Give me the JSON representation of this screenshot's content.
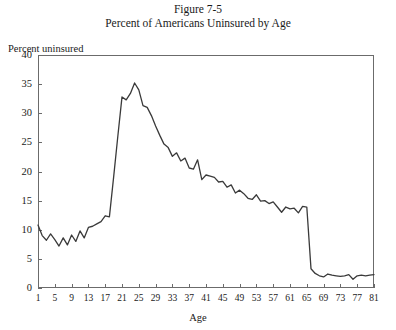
{
  "figure": {
    "number_label": "Figure 7-5",
    "caption": "Percent of Americans Uninsured by Age"
  },
  "axes": {
    "y_axis_label": "Percent uninsured",
    "x_axis_label": "Age",
    "y_ticks": [
      "0",
      "5",
      "10",
      "15",
      "20",
      "25",
      "30",
      "35",
      "40"
    ],
    "x_ticks": [
      "1",
      "5",
      "9",
      "13",
      "17",
      "21",
      "25",
      "29",
      "33",
      "37",
      "41",
      "45",
      "49",
      "53",
      "57",
      "61",
      "65",
      "69",
      "73",
      "77",
      "81"
    ]
  },
  "style": {
    "line_color": "#3a3a3a",
    "frame_color": "#6b6b6b",
    "background": "#ffffff"
  },
  "chart_data": {
    "type": "line",
    "title": "Percent of Americans Uninsured by Age",
    "subtitle": "Figure 7-5",
    "xlabel": "Age",
    "ylabel": "Percent uninsured",
    "xlim": [
      1,
      81
    ],
    "ylim": [
      0,
      40
    ],
    "ytick_step": 5,
    "xtick_step": 4,
    "grid": false,
    "legend": "none",
    "x": [
      1,
      2,
      3,
      4,
      5,
      6,
      7,
      8,
      9,
      10,
      11,
      12,
      13,
      14,
      15,
      16,
      17,
      18,
      19,
      20,
      21,
      22,
      23,
      24,
      25,
      26,
      27,
      28,
      29,
      30,
      31,
      32,
      33,
      34,
      35,
      36,
      37,
      38,
      39,
      40,
      41,
      42,
      43,
      44,
      45,
      46,
      47,
      48,
      49,
      50,
      51,
      52,
      53,
      54,
      55,
      56,
      57,
      58,
      59,
      60,
      61,
      62,
      63,
      64,
      65,
      66,
      67,
      68,
      69,
      70,
      71,
      72,
      73,
      74,
      75,
      76,
      77,
      78,
      79,
      80,
      81
    ],
    "series": [
      {
        "name": "Percent uninsured",
        "values": [
          10.8,
          9.0,
          8.2,
          9.3,
          8.3,
          7.2,
          8.6,
          7.4,
          9.1,
          8.0,
          9.8,
          8.6,
          10.4,
          10.6,
          11.0,
          11.4,
          12.4,
          12.2,
          19.0,
          26.0,
          32.8,
          32.3,
          33.4,
          35.2,
          34.0,
          31.3,
          31.0,
          29.6,
          27.8,
          26.2,
          24.7,
          24.1,
          22.6,
          23.2,
          21.8,
          22.3,
          20.6,
          20.4,
          22.0,
          18.6,
          19.4,
          19.2,
          19.0,
          18.2,
          18.3,
          17.3,
          17.7,
          16.3,
          16.8,
          16.2,
          15.4,
          15.2,
          16.0,
          14.9,
          15.0,
          14.5,
          14.8,
          13.9,
          13.0,
          13.9,
          13.6,
          13.7,
          12.9,
          14.0,
          13.9,
          3.3,
          2.5,
          2.1,
          1.9,
          2.4,
          2.2,
          2.1,
          2.0,
          2.1,
          2.3,
          1.5,
          2.1,
          2.2,
          2.1,
          2.2,
          2.3
        ]
      }
    ]
  }
}
